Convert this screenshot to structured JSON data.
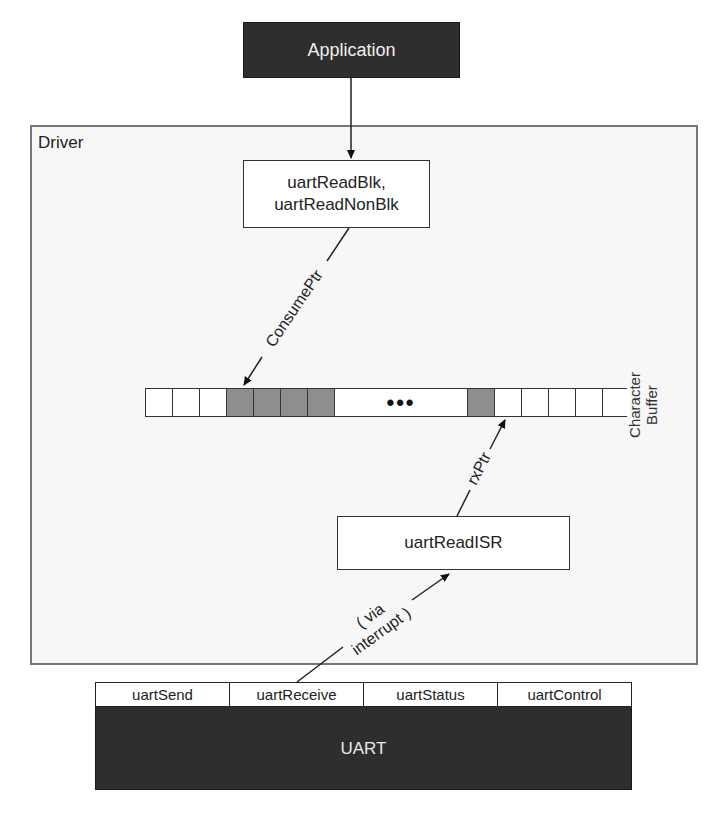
{
  "application": {
    "label": "Application"
  },
  "driver": {
    "label": "Driver",
    "read_functions": {
      "line1": "uartReadBlk,",
      "line2": "uartReadNonBlk"
    },
    "isr": {
      "label": "uartReadISR"
    },
    "buffer": {
      "label_line1": "Character",
      "label_line2": "Buffer",
      "ellipsis": "•••",
      "cells": [
        {
          "state": "empty",
          "width": 27
        },
        {
          "state": "empty",
          "width": 27
        },
        {
          "state": "empty",
          "width": 27
        },
        {
          "state": "filled",
          "width": 27
        },
        {
          "state": "filled",
          "width": 27
        },
        {
          "state": "filled",
          "width": 27
        },
        {
          "state": "filled",
          "width": 27
        },
        {
          "state": "gap",
          "width": 133
        },
        {
          "state": "filled",
          "width": 27
        },
        {
          "state": "empty",
          "width": 27
        },
        {
          "state": "empty",
          "width": 27
        },
        {
          "state": "empty",
          "width": 27
        },
        {
          "state": "empty",
          "width": 27
        },
        {
          "state": "empty",
          "width": 27
        }
      ]
    },
    "pointers": {
      "consume": "ConsumePtr",
      "rx": "rxPtr",
      "interrupt_line1": "( via",
      "interrupt_line2": "interrupt )"
    }
  },
  "uart": {
    "label": "UART",
    "functions": [
      "uartSend",
      "uartReceive",
      "uartStatus",
      "uartControl"
    ]
  },
  "colors": {
    "dark_block": "#2e2e2e",
    "filled_cell": "#8e8e8e",
    "driver_bg": "#f7f7f7",
    "border": "#333333"
  }
}
